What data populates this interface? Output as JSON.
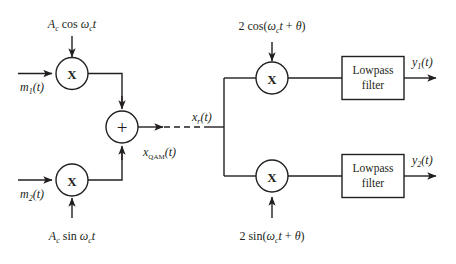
{
  "diagram": {
    "type": "block-diagram",
    "line_color": "#231f20",
    "background": "#ffffff"
  },
  "transmitter": {
    "inputs": [
      {
        "id": "m1",
        "base": "m",
        "sub": "1",
        "arg": "(t)",
        "label": "m₁(t)"
      },
      {
        "id": "m2",
        "base": "m",
        "sub": "2",
        "arg": "(t)",
        "label": "m₂(t)"
      }
    ],
    "carriers": [
      {
        "id": "carrier-cos",
        "amp": "A",
        "amp_sub": "c",
        "fn": "cos",
        "omega": "ω",
        "omega_sub": "c",
        "var": "t",
        "label": "Aₑ cos ωₑt"
      },
      {
        "id": "carrier-sin",
        "amp": "A",
        "amp_sub": "c",
        "fn": "sin",
        "omega": "ω",
        "omega_sub": "c",
        "var": "t",
        "label": "Aₑ sin ωₑt"
      }
    ],
    "multiplier_glyph": "X",
    "summer_glyph": "+",
    "output": {
      "id": "xqam",
      "base": "x",
      "sub": "QAM",
      "arg": "(t)",
      "label": "x_QAM(t)"
    }
  },
  "channel": {
    "received": {
      "id": "xr",
      "base": "x",
      "sub": "r",
      "arg": "(t)",
      "label": "x_r(t)"
    },
    "link_style": "dashed"
  },
  "receiver": {
    "local_oscillators": [
      {
        "id": "lo-cos",
        "factor": "2",
        "fn": "cos",
        "open": "(",
        "omega": "ω",
        "omega_sub": "c",
        "var": "t",
        "plus": " + ",
        "theta": "θ",
        "close": ")",
        "label": "2 cos(ωₑt + θ)"
      },
      {
        "id": "lo-sin",
        "factor": "2",
        "fn": "sin",
        "open": "(",
        "omega": "ω",
        "omega_sub": "c",
        "var": "t",
        "plus": " + ",
        "theta": "θ",
        "close": ")",
        "label": "2 sin(ωₑt + θ)"
      }
    ],
    "multiplier_glyph": "X",
    "filters": [
      {
        "id": "lpf-1",
        "line1": "Lowpass",
        "line2": "filter"
      },
      {
        "id": "lpf-2",
        "line1": "Lowpass",
        "line2": "filter"
      }
    ],
    "outputs": [
      {
        "id": "y1",
        "base": "y",
        "sub": "1",
        "arg": "(t)",
        "label": "y₁(t)"
      },
      {
        "id": "y2",
        "base": "y",
        "sub": "2",
        "arg": "(t)",
        "label": "y₂(t)"
      }
    ]
  }
}
